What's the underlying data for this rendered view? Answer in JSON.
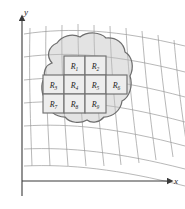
{
  "figure": {
    "axes": {
      "x_label": "x",
      "y_label": "y",
      "axis_color": "#3a3a3a",
      "origin_x": 22,
      "origin_y": 181
    },
    "grid": {
      "type": "curvilinear",
      "line_color": "#9a9a9a",
      "vertical_lines": 9,
      "horizontal_lines": 7
    },
    "region": {
      "name": "R",
      "fill_color": "#e0e0e0",
      "stroke_color": "#6e6e6e"
    },
    "subrectangles": {
      "cell_fill": "#ededed",
      "cell_stroke": "#707070",
      "count": 9,
      "rows": [
        {
          "row": 1,
          "cells": [
            {
              "id": "R1",
              "base": "R",
              "sub": "1",
              "col": 2
            },
            {
              "id": "R2",
              "base": "R",
              "sub": "2",
              "col": 3
            }
          ]
        },
        {
          "row": 2,
          "cells": [
            {
              "id": "R3",
              "base": "R",
              "sub": "3",
              "col": 1
            },
            {
              "id": "R4",
              "base": "R",
              "sub": "4",
              "col": 2
            },
            {
              "id": "R5",
              "base": "R",
              "sub": "5",
              "col": 3
            },
            {
              "id": "R6",
              "base": "R",
              "sub": "6",
              "col": 4
            }
          ]
        },
        {
          "row": 3,
          "cells": [
            {
              "id": "R7",
              "base": "R",
              "sub": "7",
              "col": 1
            },
            {
              "id": "R8",
              "base": "R",
              "sub": "8",
              "col": 2
            },
            {
              "id": "R9",
              "base": "R",
              "sub": "9",
              "col": 3
            }
          ]
        }
      ]
    }
  }
}
